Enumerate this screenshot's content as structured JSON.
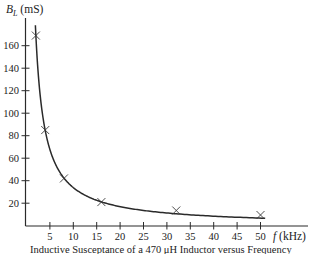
{
  "chart_data": {
    "type": "line",
    "title": "Inductive Susceptance of a 470 μH Inductor versus Frequency",
    "xlabel": "f (kHz)",
    "ylabel": "B_L (mS)",
    "xlabel_italic_part": "f",
    "xlabel_unit": "(kHz)",
    "ylabel_symbol": "B",
    "ylabel_subscript": "L",
    "ylabel_unit": "(mS)",
    "xlim": [
      0,
      57
    ],
    "ylim": [
      0,
      180
    ],
    "x_ticks": [
      5,
      10,
      15,
      20,
      25,
      30,
      35,
      40,
      45,
      50
    ],
    "y_ticks": [
      20,
      40,
      60,
      80,
      100,
      120,
      140,
      160
    ],
    "grid": false,
    "legend": null,
    "curve_formula": "B_L = 1 / (2π f L), L = 470 μH",
    "inductance_uH": 470,
    "series": [
      {
        "name": "Measured points (×)",
        "marker": "x",
        "x": [
          2,
          4,
          8,
          16,
          32,
          50
        ],
        "values": [
          169,
          85,
          42,
          21,
          11,
          7
        ]
      },
      {
        "name": "Theoretical curve",
        "marker": "none",
        "style": "solid",
        "x_range": [
          1.9,
          51
        ]
      }
    ]
  },
  "ui": {
    "caption": "Inductive Susceptance of a 470 μH Inductor versus Frequency",
    "x_axis_label_italic": "f",
    "x_axis_label_unit": " (kHz)",
    "y_axis_label_symbol": "B",
    "y_axis_label_sub": "L",
    "y_axis_label_unit": " (mS)"
  }
}
